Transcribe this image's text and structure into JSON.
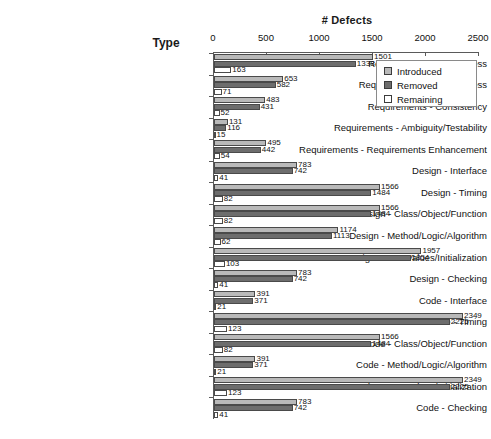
{
  "chart_data": {
    "type": "bar",
    "orientation": "horizontal",
    "title": "",
    "xlabel": "# Defects",
    "ylabel": "Type",
    "xlim": [
      0,
      2500
    ],
    "xticks": [
      0,
      500,
      1000,
      1500,
      2000,
      2500
    ],
    "grid": false,
    "legend_position": "top-right",
    "legend": [
      "Introduced",
      "Removed",
      "Remaining"
    ],
    "categories": [
      "Requirements - Correctness",
      "Requirements - Completeness",
      "Requirements - Consistency",
      "Requirements - Ambiguity/Testability",
      "Requirements - Requirements Enhancement",
      "Design - Interface",
      "Design - Timing",
      "Design - Class/Object/Function",
      "Design - Method/Logic/Algorithm",
      "Design - Data Values/Initialization",
      "Design - Checking",
      "Code - Interface",
      "Code - Timing",
      "Code - Class/Object/Function",
      "Code - Method/Logic/Algorithm",
      "Code - Data Values/Initialization",
      "Code - Checking"
    ],
    "series": [
      {
        "name": "Introduced",
        "color": "#b9b9b9",
        "values": [
          1501,
          653,
          483,
          131,
          495,
          783,
          1566,
          1566,
          1174,
          1957,
          783,
          391,
          2349,
          1566,
          391,
          2349,
          783
        ]
      },
      {
        "name": "Removed",
        "color": "#6d6d6d",
        "values": [
          1338,
          582,
          431,
          116,
          442,
          742,
          1484,
          1484,
          1113,
          1854,
          742,
          371,
          2225,
          1484,
          371,
          2225,
          742
        ]
      },
      {
        "name": "Remaining",
        "color": "#ffffff",
        "values": [
          163,
          71,
          52,
          15,
          54,
          41,
          82,
          82,
          62,
          103,
          41,
          21,
          123,
          82,
          21,
          123,
          41
        ]
      }
    ]
  }
}
